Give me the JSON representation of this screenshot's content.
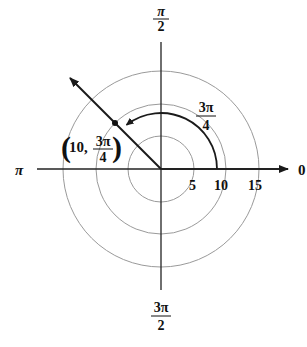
{
  "diagram": {
    "type": "polar-coordinate-plot",
    "center": {
      "x": 161,
      "y": 169
    },
    "colors": {
      "axis": "#222222",
      "circle": "#9a9a9a",
      "ray": "#1a1a1a",
      "text": "#111111"
    },
    "circles": [
      {
        "r_value": 5,
        "label": "5"
      },
      {
        "r_value": 10,
        "label": "10"
      },
      {
        "r_value": 15,
        "label": "15"
      }
    ],
    "axis_labels": {
      "right": "0",
      "top_num": "π",
      "top_den": "2",
      "left": "π",
      "bottom_num": "3π",
      "bottom_den": "2"
    },
    "angle_arc": {
      "label_num": "3π",
      "label_den": "4",
      "angle": "3π/4"
    },
    "point": {
      "r": 10,
      "theta": "3π/4",
      "label_prefix": "10,",
      "label_num": "3π",
      "label_den": "4"
    }
  }
}
